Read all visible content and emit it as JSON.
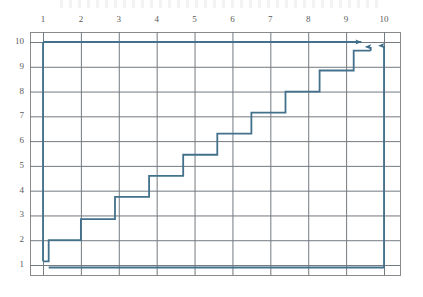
{
  "chart_data": {
    "type": "line",
    "title": "",
    "subtitle": "",
    "xlabel": "",
    "ylabel": "",
    "xlim": [
      0.5,
      10.5
    ],
    "ylim": [
      0.5,
      10.5
    ],
    "grid": true,
    "legend_position": "none",
    "x_ticks": [
      1,
      2,
      3,
      4,
      5,
      6,
      7,
      8,
      9,
      10
    ],
    "x_tick_labels": [
      "1",
      "2",
      "3",
      "4",
      "5",
      "6",
      "7",
      "8",
      "9",
      "10"
    ],
    "y_ticks": [
      1,
      2,
      3,
      4,
      5,
      6,
      7,
      8,
      9,
      10
    ],
    "y_tick_labels": [
      "1",
      "2",
      "3",
      "4",
      "5",
      "6",
      "7",
      "8",
      "9",
      "10"
    ],
    "x_axis_position": "top",
    "y_axis_position": "left",
    "line_color": "#43718c",
    "grid_color": "#737a80",
    "border_color": "#8a8a8a",
    "series": [
      {
        "name": "staircase",
        "step_type": "post",
        "points": [
          [
            1.0,
            1.15
          ],
          [
            1.15,
            1.15
          ],
          [
            1.15,
            2.0
          ],
          [
            2.0,
            2.0
          ],
          [
            2.0,
            2.85
          ],
          [
            2.9,
            2.85
          ],
          [
            2.9,
            3.75
          ],
          [
            3.8,
            3.75
          ],
          [
            3.8,
            4.6
          ],
          [
            4.7,
            4.6
          ],
          [
            4.7,
            5.45
          ],
          [
            5.6,
            5.45
          ],
          [
            5.6,
            6.3
          ],
          [
            6.5,
            6.3
          ],
          [
            6.5,
            7.15
          ],
          [
            7.4,
            7.15
          ],
          [
            7.4,
            8.0
          ],
          [
            8.3,
            8.0
          ],
          [
            8.3,
            8.85
          ],
          [
            9.2,
            8.85
          ],
          [
            9.2,
            9.65
          ],
          [
            9.65,
            9.65
          ]
        ]
      },
      {
        "name": "upper-horizontal-arrow",
        "points": [
          [
            1.0,
            10.0
          ],
          [
            9.4,
            10.0
          ]
        ],
        "arrow_end": true
      },
      {
        "name": "left-vertical-drop",
        "points": [
          [
            1.0,
            10.0
          ],
          [
            1.0,
            1.15
          ]
        ],
        "arrow_end": false
      },
      {
        "name": "baseline",
        "points": [
          [
            1.15,
            0.9
          ],
          [
            10.0,
            0.9
          ]
        ],
        "arrow_end": false
      },
      {
        "name": "right-vertical-arrow-long",
        "points": [
          [
            10.0,
            0.9
          ],
          [
            10.0,
            9.85
          ]
        ],
        "arrow_end": true
      },
      {
        "name": "right-vertical-arrow-short",
        "points": [
          [
            9.65,
            9.65
          ],
          [
            9.65,
            9.8
          ]
        ],
        "arrow_end": true
      }
    ],
    "annotations": []
  }
}
